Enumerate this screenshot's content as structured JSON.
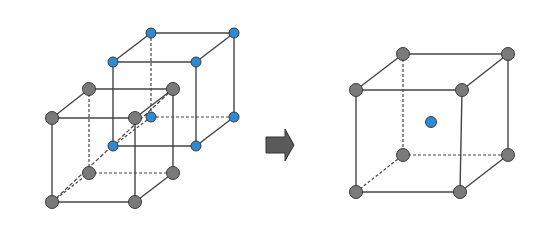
{
  "diagram": {
    "colors": {
      "gray_atom": "#7a7a7a",
      "blue_atom": "#2f8ad6",
      "outline": "#3a3a3a",
      "edge": "#444444",
      "arrow": "#5a5a5a"
    },
    "left_group": {
      "gray_cube": {
        "label": "gray simple cubic lattice",
        "atoms": [
          {
            "id": "ftl",
            "x": 52,
            "y": 118
          },
          {
            "id": "ftr",
            "x": 135,
            "y": 118
          },
          {
            "id": "fbl",
            "x": 52,
            "y": 202
          },
          {
            "id": "fbr",
            "x": 135,
            "y": 202
          },
          {
            "id": "btl",
            "x": 89,
            "y": 89
          },
          {
            "id": "btr",
            "x": 173,
            "y": 89
          },
          {
            "id": "bbl",
            "x": 89,
            "y": 173
          },
          {
            "id": "bbr",
            "x": 173,
            "y": 173
          }
        ]
      },
      "blue_cube": {
        "label": "blue simple cubic lattice",
        "atoms": [
          {
            "id": "ftl",
            "x": 113,
            "y": 62
          },
          {
            "id": "ftr",
            "x": 196,
            "y": 62
          },
          {
            "id": "fbl",
            "x": 113,
            "y": 146
          },
          {
            "id": "fbr",
            "x": 196,
            "y": 146
          },
          {
            "id": "btl",
            "x": 151,
            "y": 33
          },
          {
            "id": "btr",
            "x": 234,
            "y": 33
          },
          {
            "id": "bbl",
            "x": 151,
            "y": 117
          },
          {
            "id": "bbr",
            "x": 234,
            "y": 117
          }
        ]
      }
    },
    "arrow": {
      "label": "right arrow",
      "x1": 266,
      "x2": 294,
      "y_mid": 145
    },
    "right_group": {
      "bcc_cube": {
        "label": "body-centered cubic unit cell",
        "atoms": [
          {
            "id": "ftl",
            "x": 356,
            "y": 90
          },
          {
            "id": "ftr",
            "x": 462,
            "y": 90
          },
          {
            "id": "fbl",
            "x": 356,
            "y": 192
          },
          {
            "id": "fbr",
            "x": 460,
            "y": 192
          },
          {
            "id": "btl",
            "x": 403,
            "y": 54
          },
          {
            "id": "btr",
            "x": 508,
            "y": 54
          },
          {
            "id": "bbl",
            "x": 403,
            "y": 155
          },
          {
            "id": "bbr",
            "x": 508,
            "y": 155
          }
        ],
        "center_atom": {
          "x": 431,
          "y": 122
        }
      }
    }
  }
}
